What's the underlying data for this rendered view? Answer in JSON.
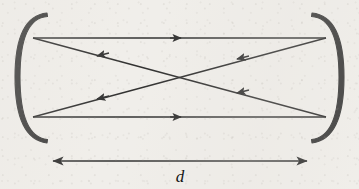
{
  "figure": {
    "width": 359,
    "height": 189,
    "background_color": "#f0eeea",
    "ink_color": "#1a1a1a",
    "mirror_color": "#262626"
  },
  "labels": {
    "distance": "d"
  },
  "mirrors": [
    {
      "name": "left-mirror",
      "side": "left",
      "outer_apex_x": 15,
      "inner_apex_x": 20,
      "top_y": 13,
      "bottom_y": 143,
      "edge_x": 47,
      "thickness": 5
    },
    {
      "name": "right-mirror",
      "side": "right",
      "outer_apex_x": 344,
      "inner_apex_x": 339,
      "top_y": 13,
      "bottom_y": 143,
      "edge_x": 312,
      "thickness": 5
    }
  ],
  "rays": [
    {
      "name": "top-horizontal-ray",
      "x1": 33,
      "y1": 38,
      "x2": 326,
      "y2": 38,
      "direction": "right",
      "arrow_x": 180,
      "arrow_y": 38
    },
    {
      "name": "bottom-horizontal-ray",
      "x1": 33,
      "y1": 117,
      "x2": 326,
      "y2": 117,
      "direction": "right",
      "arrow_x": 180,
      "arrow_y": 117
    },
    {
      "name": "diagonal-upper-left-to-lower-right",
      "x1": 33,
      "y1": 38,
      "x2": 326,
      "y2": 117,
      "direction": "left",
      "arrow_x": 237,
      "arrow_y": 93
    },
    {
      "name": "diagonal-lower-left-to-upper-right",
      "x1": 33,
      "y1": 117,
      "x2": 326,
      "y2": 38,
      "direction": "left",
      "arrow_x": 237,
      "arrow_y": 59
    },
    {
      "name": "diagonal-upper-right-to-lower-left",
      "x1": 326,
      "y1": 38,
      "x2": 33,
      "y2": 117,
      "direction": "left",
      "arrow_x": 98,
      "arrow_y": 99
    },
    {
      "name": "diagonal-lower-right-to-upper-left",
      "x1": 326,
      "y1": 117,
      "x2": 33,
      "y2": 38,
      "direction": "left",
      "arrow_x": 98,
      "arrow_y": 56
    }
  ],
  "crossing_point": {
    "x": 179,
    "y": 77
  },
  "dimension": {
    "name": "cavity-length-dimension",
    "x1": 52,
    "x2": 308,
    "y": 161,
    "label": "d",
    "label_x": 180,
    "label_y": 167,
    "double_headed": true
  }
}
